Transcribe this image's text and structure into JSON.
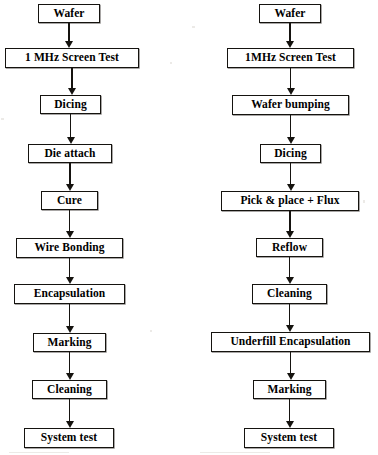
{
  "document": {
    "type": "process-flow-diagram",
    "title": "Semiconductor assembly process flows",
    "background_color": "#ffffff",
    "line_color": "#15130f",
    "text_color": "#000000"
  },
  "chart_data": {
    "type": "diagram",
    "columns": [
      {
        "name": "wire-bond-flow",
        "center_x": 70,
        "steps": [
          "Wafer",
          "1 MHz Screen Test",
          "Dicing",
          "Die attach",
          "Cure",
          "Wire Bonding",
          "Encapsulation",
          "Marking",
          "Cleaning",
          "System test"
        ]
      },
      {
        "name": "flip-chip-flow",
        "center_x": 290,
        "steps": [
          "Wafer",
          "1MHz Screen Test",
          "Wafer bumping",
          "Dicing",
          "Pick & place + Flux",
          "Reflow",
          "Cleaning",
          "Underfill Encapsulation",
          "Marking",
          "System test"
        ]
      }
    ]
  },
  "left_flow": {
    "nodes": [
      {
        "label": "Wafer",
        "x": 38,
        "y": 4,
        "w": 62,
        "h": 19
      },
      {
        "label": "1 MHz Screen Test",
        "x": 5,
        "y": 48,
        "w": 134,
        "h": 20
      },
      {
        "label": "Dicing",
        "x": 40,
        "y": 95,
        "w": 61,
        "h": 19
      },
      {
        "label": "Die attach",
        "x": 28,
        "y": 144,
        "w": 84,
        "h": 19
      },
      {
        "label": "Cure",
        "x": 41,
        "y": 191,
        "w": 57,
        "h": 19
      },
      {
        "label": "Wire Bonding",
        "x": 16,
        "y": 238,
        "w": 107,
        "h": 20
      },
      {
        "label": "Encapsulation",
        "x": 14,
        "y": 284,
        "w": 111,
        "h": 20
      },
      {
        "label": "Marking",
        "x": 33,
        "y": 333,
        "w": 73,
        "h": 19
      },
      {
        "label": "Cleaning",
        "x": 32,
        "y": 380,
        "w": 75,
        "h": 19
      },
      {
        "label": "System test",
        "x": 24,
        "y": 428,
        "w": 90,
        "h": 20
      }
    ],
    "connectors": [
      {
        "y": 23,
        "h": 25
      },
      {
        "y": 68,
        "h": 27
      },
      {
        "y": 114,
        "h": 30
      },
      {
        "y": 163,
        "h": 28
      },
      {
        "y": 210,
        "h": 28
      },
      {
        "y": 258,
        "h": 26
      },
      {
        "y": 304,
        "h": 29
      },
      {
        "y": 352,
        "h": 28
      },
      {
        "y": 399,
        "h": 29
      }
    ]
  },
  "right_flow": {
    "nodes": [
      {
        "label": "Wafer",
        "x": 259,
        "y": 4,
        "w": 62,
        "h": 19
      },
      {
        "label": "1MHz Screen Test",
        "x": 227,
        "y": 48,
        "w": 127,
        "h": 20
      },
      {
        "label": "Wafer bumping",
        "x": 232,
        "y": 95,
        "w": 117,
        "h": 20
      },
      {
        "label": "Dicing",
        "x": 260,
        "y": 144,
        "w": 61,
        "h": 19
      },
      {
        "label": "Pick & place + Flux",
        "x": 221,
        "y": 191,
        "w": 138,
        "h": 20
      },
      {
        "label": "Reflow",
        "x": 256,
        "y": 238,
        "w": 67,
        "h": 19
      },
      {
        "label": "Cleaning",
        "x": 252,
        "y": 284,
        "w": 75,
        "h": 20
      },
      {
        "label": "Underfill Encapsulation",
        "x": 211,
        "y": 332,
        "w": 159,
        "h": 20
      },
      {
        "label": "Marking",
        "x": 253,
        "y": 380,
        "w": 73,
        "h": 19
      },
      {
        "label": "System test",
        "x": 244,
        "y": 428,
        "w": 90,
        "h": 20
      }
    ],
    "connectors": [
      {
        "y": 23,
        "h": 25
      },
      {
        "y": 68,
        "h": 27
      },
      {
        "y": 115,
        "h": 29
      },
      {
        "y": 163,
        "h": 28
      },
      {
        "y": 211,
        "h": 27
      },
      {
        "y": 257,
        "h": 27
      },
      {
        "y": 304,
        "h": 28
      },
      {
        "y": 352,
        "h": 28
      },
      {
        "y": 399,
        "h": 29
      }
    ]
  }
}
